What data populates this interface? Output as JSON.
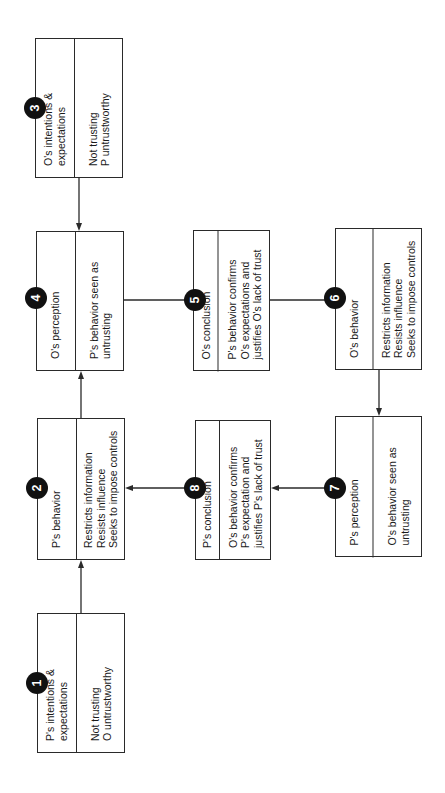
{
  "diagram": {
    "orientation": "rotated-90-ccw",
    "colors": {
      "line": "#2a2a2a",
      "badge_fill": "#111111",
      "badge_text": "#ffffff",
      "background": "#ffffff"
    },
    "boxes": [
      {
        "id": 1,
        "number": "1",
        "title": "P's intentions &\nexpectations",
        "body": "Not trusting\nO untrustworthy"
      },
      {
        "id": 2,
        "number": "2",
        "title": "P's behavior",
        "body": "Restricts information\nResists influence\nSeeks to impose controls"
      },
      {
        "id": 3,
        "number": "3",
        "title": "O's intentions &\nexpectations",
        "body": "Not trusting\nP untrustworthy"
      },
      {
        "id": 4,
        "number": "4",
        "title": "O's perception",
        "body": "P's behavior seen as\nuntrusting"
      },
      {
        "id": 5,
        "number": "5",
        "title": "O's conclusion",
        "body": "P's behavior confirms\nO's expectations and\njustifies O's lack of trust"
      },
      {
        "id": 6,
        "number": "6",
        "title": "O's behavior",
        "body": "Restricts information\nResists influence\nSeeks to impose controls"
      },
      {
        "id": 7,
        "number": "7",
        "title": "P's perception",
        "body": "O's behavior seen as\nuntrusting"
      },
      {
        "id": 8,
        "number": "8",
        "title": "P's conclusion",
        "body": "O's behavior confirms\nP's expectation and\njustifies P's lack of trust"
      }
    ],
    "edges": [
      {
        "from": 1,
        "to": 2
      },
      {
        "from": 2,
        "to": 4
      },
      {
        "from": 3,
        "to": 4
      },
      {
        "from": 4,
        "to": 5
      },
      {
        "from": 5,
        "to": 6
      },
      {
        "from": 6,
        "to": 7
      },
      {
        "from": 7,
        "to": 8
      },
      {
        "from": 8,
        "to": 2
      }
    ]
  }
}
